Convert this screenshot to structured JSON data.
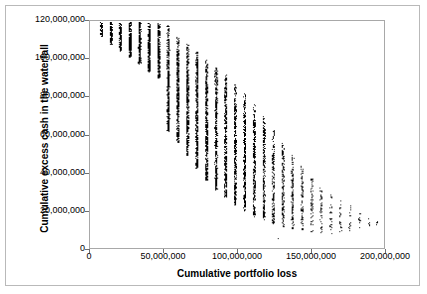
{
  "chart_data": {
    "type": "scatter",
    "title": "",
    "xlabel": "Cumulative portfolio loss",
    "ylabel": "Cumulative excess cash in the waterfall",
    "xlim": [
      0,
      200000000
    ],
    "ylim": [
      0,
      120000000
    ],
    "grid": false,
    "legend": null,
    "xticks": [
      0,
      50000000,
      100000000,
      150000000,
      200000000
    ],
    "xtick_labels": [
      "0",
      "50,000,000",
      "100,000,000",
      "150,000,000",
      "200,000,000"
    ],
    "yticks": [
      0,
      20000000,
      40000000,
      60000000,
      80000000,
      100000000,
      120000000
    ],
    "ytick_labels": [
      "0",
      "20,000,000",
      "40,000,000",
      "60,000,000",
      "80,000,000",
      "100,000,000",
      "120,000,000"
    ],
    "marker": {
      "shape": "square",
      "size_px": 1,
      "color": "#000000"
    },
    "columns": [
      {
        "x": 7500000,
        "y_min": 112000000,
        "y_max": 119500000,
        "n": 60
      },
      {
        "x": 14000000,
        "y_min": 108000000,
        "y_max": 119500000,
        "n": 110
      },
      {
        "x": 20500000,
        "y_min": 104500000,
        "y_max": 119500000,
        "n": 150
      },
      {
        "x": 27000000,
        "y_min": 101000000,
        "y_max": 119500000,
        "n": 200
      },
      {
        "x": 33500000,
        "y_min": 97500000,
        "y_max": 119500000,
        "n": 240
      },
      {
        "x": 40000000,
        "y_min": 93500000,
        "y_max": 119000000,
        "n": 270
      },
      {
        "x": 46500000,
        "y_min": 90000000,
        "y_max": 119000000,
        "n": 300
      },
      {
        "x": 53000000,
        "y_min": 62000000,
        "y_max": 118500000,
        "n": 420
      },
      {
        "x": 59500000,
        "y_min": 56000000,
        "y_max": 112000000,
        "n": 430
      },
      {
        "x": 66000000,
        "y_min": 49000000,
        "y_max": 108000000,
        "n": 430
      },
      {
        "x": 72500000,
        "y_min": 42000000,
        "y_max": 104000000,
        "n": 430
      },
      {
        "x": 79000000,
        "y_min": 36000000,
        "y_max": 100000000,
        "n": 420
      },
      {
        "x": 85500000,
        "y_min": 31000000,
        "y_max": 96000000,
        "n": 400
      },
      {
        "x": 92000000,
        "y_min": 27000000,
        "y_max": 92000000,
        "n": 380
      },
      {
        "x": 98500000,
        "y_min": 23000000,
        "y_max": 87000000,
        "n": 350
      },
      {
        "x": 105000000,
        "y_min": 20000000,
        "y_max": 82000000,
        "n": 320
      },
      {
        "x": 111500000,
        "y_min": 17000000,
        "y_max": 76000000,
        "n": 280
      },
      {
        "x": 118000000,
        "y_min": 15000000,
        "y_max": 70000000,
        "n": 240
      },
      {
        "x": 124500000,
        "y_min": 13000000,
        "y_max": 63000000,
        "n": 200
      },
      {
        "x": 131000000,
        "y_min": 11000000,
        "y_max": 56000000,
        "n": 160
      },
      {
        "x": 137500000,
        "y_min": 10000000,
        "y_max": 50000000,
        "n": 120
      },
      {
        "x": 144000000,
        "y_min": 9000000,
        "y_max": 44000000,
        "n": 90
      },
      {
        "x": 150500000,
        "y_min": 8500000,
        "y_max": 38000000,
        "n": 65
      },
      {
        "x": 157000000,
        "y_min": 8000000,
        "y_max": 33000000,
        "n": 45
      },
      {
        "x": 163500000,
        "y_min": 8000000,
        "y_max": 29000000,
        "n": 32
      },
      {
        "x": 170000000,
        "y_min": 8000000,
        "y_max": 26000000,
        "n": 22
      },
      {
        "x": 176500000,
        "y_min": 9000000,
        "y_max": 23000000,
        "n": 15
      },
      {
        "x": 183000000,
        "y_min": 10000000,
        "y_max": 20000000,
        "n": 10
      },
      {
        "x": 189500000,
        "y_min": 11000000,
        "y_max": 17000000,
        "n": 7
      },
      {
        "x": 195000000,
        "y_min": 12000000,
        "y_max": 15000000,
        "n": 4
      }
    ],
    "outliers": [
      {
        "x": 128000000,
        "y": 5000000
      }
    ]
  }
}
